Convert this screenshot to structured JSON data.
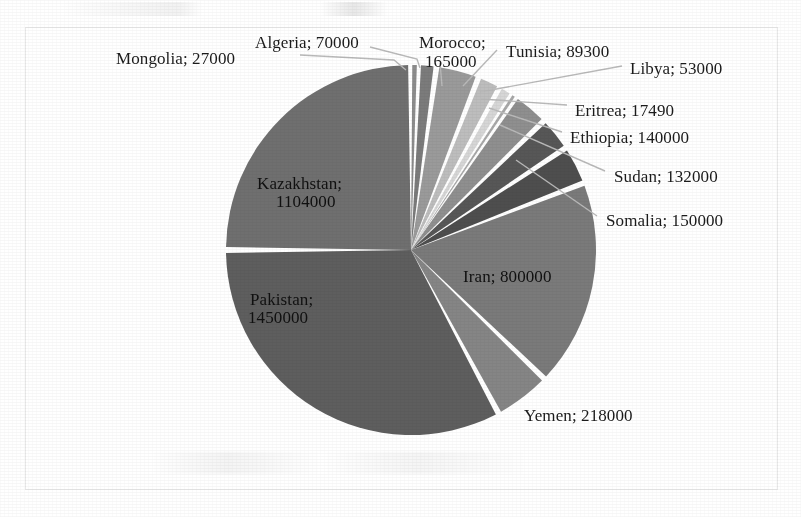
{
  "figure": {
    "frame": {
      "x": 25,
      "y": 27,
      "width": 753,
      "height": 463,
      "border_color": "#e9e9e9"
    },
    "background": "#ffffff"
  },
  "chart_data": {
    "type": "pie",
    "title": "",
    "xlabel": "",
    "ylabel": "",
    "legend_position": "none",
    "label_format": "{name}; {value}",
    "grid": false,
    "center": {
      "x": 411,
      "y": 250
    },
    "radius": 185,
    "start_angle_deg": 180,
    "direction": "clockwise",
    "total": 4416790,
    "categories": [
      "Kazakhstan",
      "Mongolia",
      "Algeria",
      "Morocco",
      "Tunisia",
      "Libya",
      "Eritrea",
      "Ethiopia",
      "Sudan",
      "Somalia",
      "Iran",
      "Yemen",
      "Pakistan"
    ],
    "values": [
      1104000,
      27000,
      70000,
      165000,
      89300,
      53000,
      17490,
      140000,
      132000,
      150000,
      800000,
      218000,
      1450000
    ],
    "slices": [
      {
        "name": "Kazakhstan",
        "value": 1104000,
        "label": "Kazakhstan;\n1104000",
        "color": "#6f6f6f",
        "label_placement": "inside"
      },
      {
        "name": "Mongolia",
        "value": 27000,
        "label": "Mongolia; 27000",
        "color": "#8c8c8c",
        "label_placement": "outside-left"
      },
      {
        "name": "Algeria",
        "value": 70000,
        "label": "Algeria; 70000",
        "color": "#7b7b7b",
        "label_placement": "outside-top"
      },
      {
        "name": "Morocco",
        "value": 165000,
        "label": "Morocco;\n165000",
        "color": "#9a9a9a",
        "label_placement": "outside-top"
      },
      {
        "name": "Tunisia",
        "value": 89300,
        "label": "Tunisia; 89300",
        "color": "#bdbdbd",
        "label_placement": "outside-top"
      },
      {
        "name": "Libya",
        "value": 53000,
        "label": "Libya; 53000",
        "color": "#d6d6d6",
        "label_placement": "outside-right"
      },
      {
        "name": "Eritrea",
        "value": 17490,
        "label": "Eritrea; 17490",
        "color": "#a8a8a8",
        "label_placement": "outside-right"
      },
      {
        "name": "Ethiopia",
        "value": 140000,
        "label": "Ethiopia; 140000",
        "color": "#8f8f8f",
        "label_placement": "outside-right"
      },
      {
        "name": "Sudan",
        "value": 132000,
        "label": "Sudan; 132000",
        "color": "#575757",
        "label_placement": "outside-right"
      },
      {
        "name": "Somalia",
        "value": 150000,
        "label": "Somalia; 150000",
        "color": "#4e4e4e",
        "label_placement": "outside-right"
      },
      {
        "name": "Iran",
        "value": 800000,
        "label": "Iran; 800000",
        "color": "#7a7a7a",
        "label_placement": "inside"
      },
      {
        "name": "Yemen",
        "value": 218000,
        "label": "Yemen; 218000",
        "color": "#858585",
        "label_placement": "outside-bottom"
      },
      {
        "name": "Pakistan",
        "value": 1450000,
        "label": "Pakistan;\n1450000",
        "color": "#5e5e5e",
        "label_placement": "inside"
      }
    ]
  },
  "labels": {
    "mongolia": {
      "text": "Mongolia; 27000",
      "x": 116,
      "y": 49
    },
    "algeria": {
      "text": "Algeria; 70000",
      "x": 255,
      "y": 33
    },
    "morocco_l1": {
      "text": "Morocco;",
      "x": 419,
      "y": 33
    },
    "morocco_l2": {
      "text": "165000",
      "x": 425,
      "y": 52
    },
    "tunisia": {
      "text": "Tunisia; 89300",
      "x": 506,
      "y": 42
    },
    "libya": {
      "text": "Libya; 53000",
      "x": 630,
      "y": 59
    },
    "eritrea": {
      "text": "Eritrea; 17490",
      "x": 575,
      "y": 101
    },
    "ethiopia": {
      "text": "Ethiopia; 140000",
      "x": 570,
      "y": 128
    },
    "sudan": {
      "text": "Sudan; 132000",
      "x": 614,
      "y": 167
    },
    "somalia": {
      "text": "Somalia; 150000",
      "x": 606,
      "y": 211
    },
    "kazakhstan_l1": {
      "text": "Kazakhstan;",
      "x": 257,
      "y": 174
    },
    "kazakhstan_l2": {
      "text": "1104000",
      "x": 276,
      "y": 192
    },
    "pakistan_l1": {
      "text": "Pakistan;",
      "x": 250,
      "y": 290
    },
    "pakistan_l2": {
      "text": "1450000",
      "x": 248,
      "y": 308
    },
    "iran": {
      "text": "Iran; 800000",
      "x": 463,
      "y": 267
    },
    "yemen": {
      "text": "Yemen; 218000",
      "x": 524,
      "y": 406
    }
  },
  "colors": {
    "leader_line": "#b9b9b9",
    "slice_gap": "#ffffff",
    "text": "#1b1b1b",
    "frame_border": "#e9e9e9"
  }
}
